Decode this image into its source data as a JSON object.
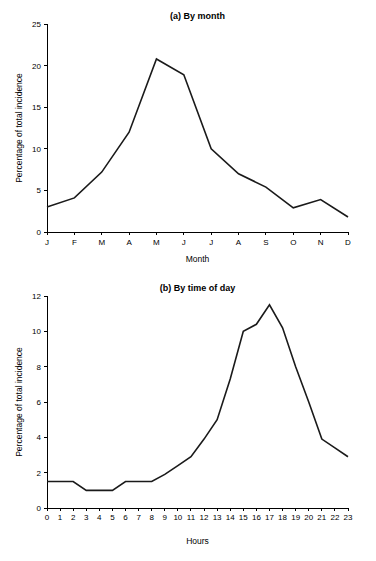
{
  "page": {
    "background": "#ffffff",
    "line_color": "#1a1a1a",
    "axis_color": "#000000"
  },
  "chart_data": [
    {
      "id": "by-month",
      "type": "line",
      "title": "(a) By month",
      "xlabel": "Month",
      "ylabel": "Percentage of total incidence",
      "categories": [
        "J",
        "F",
        "M",
        "A",
        "M",
        "J",
        "J",
        "A",
        "S",
        "O",
        "N",
        "D"
      ],
      "category_names": [
        "January",
        "February",
        "March",
        "April",
        "May",
        "June",
        "July",
        "August",
        "September",
        "October",
        "November",
        "December"
      ],
      "values": [
        3.0,
        4.1,
        7.2,
        12.0,
        20.8,
        18.9,
        10.0,
        7.0,
        5.4,
        2.9,
        3.9,
        1.8
      ],
      "xlim": [
        0,
        11
      ],
      "ylim": [
        0,
        25
      ],
      "yticks": [
        0,
        5,
        10,
        15,
        20,
        25
      ],
      "ytick_labels": [
        "0",
        "5",
        "10",
        "15",
        "20",
        "25"
      ],
      "grid": false,
      "legend": "none"
    },
    {
      "id": "by-time-of-day",
      "type": "line",
      "title": "(b) By time of day",
      "xlabel": "Hours",
      "ylabel": "Percentage of total incidence",
      "categories": [
        "0",
        "1",
        "2",
        "3",
        "4",
        "5",
        "6",
        "7",
        "8",
        "9",
        "10",
        "11",
        "12",
        "13",
        "14",
        "15",
        "16",
        "17",
        "18",
        "19",
        "20",
        "21",
        "22",
        "23"
      ],
      "values": [
        1.5,
        1.5,
        1.5,
        1.0,
        1.0,
        1.0,
        1.5,
        1.5,
        1.5,
        1.9,
        2.4,
        2.9,
        3.9,
        5.0,
        7.3,
        10.0,
        10.4,
        11.5,
        10.2,
        8.0,
        6.0,
        3.9,
        3.4,
        2.9
      ],
      "xlim": [
        0,
        23
      ],
      "ylim": [
        0,
        12
      ],
      "yticks": [
        0,
        2,
        4,
        6,
        8,
        10,
        12
      ],
      "ytick_labels": [
        "0",
        "2",
        "4",
        "6",
        "8",
        "10",
        "12"
      ],
      "grid": false,
      "legend": "none"
    }
  ]
}
